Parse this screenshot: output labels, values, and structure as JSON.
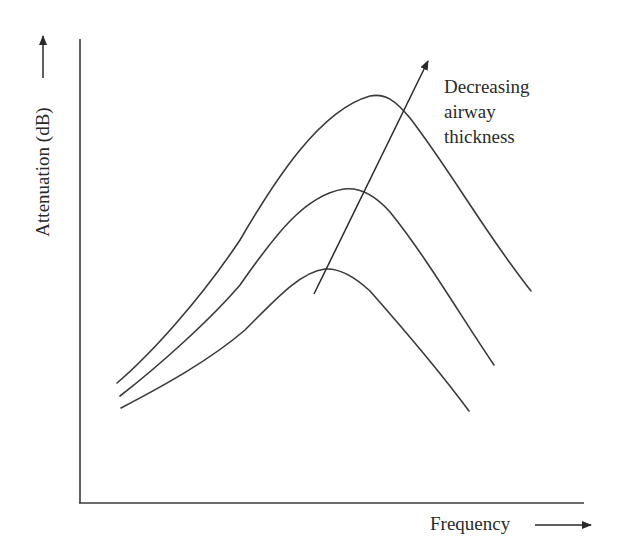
{
  "figure": {
    "type": "schematic line diagram",
    "y_axis_label": "Attenuation (dB)",
    "x_axis_label": "Frequency",
    "annotation": {
      "lines": [
        "Decreasing",
        "airway",
        "thickness"
      ],
      "arrow_direction": "up-right, crossing curves from lowest to highest peak"
    },
    "colors": {
      "line": "#3a3a3a",
      "text": "#2a2a2a",
      "background": "#ffffff"
    },
    "curves": [
      {
        "name": "thick-airway",
        "rank": "lowest peak"
      },
      {
        "name": "medium-airway",
        "rank": "middle peak"
      },
      {
        "name": "thin-airway",
        "rank": "highest peak"
      }
    ]
  }
}
